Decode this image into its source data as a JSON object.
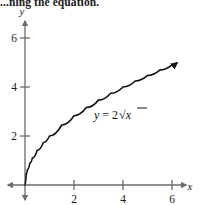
{
  "header": {
    "cutoff_text": "...ning the equation."
  },
  "figure": {
    "axis_x_label": "x",
    "axis_y_label": "y",
    "equation_label": "y = 2√x",
    "equation_parts": {
      "lhs": "y",
      "operator": "=",
      "coefficient": "2",
      "radicand": "x"
    },
    "colors": {
      "axis": "#6b6b6b",
      "curve": "#111111",
      "text": "#1a1a1a",
      "background": "#ffffff"
    }
  },
  "chart_data": {
    "type": "line",
    "title": "",
    "xlabel": "x",
    "ylabel": "y",
    "xlim": [
      -0.8,
      7.1
    ],
    "ylim": [
      -0.9,
      6.7
    ],
    "xticks": [
      2,
      4,
      6
    ],
    "yticks": [
      2,
      4,
      6
    ],
    "xtick_labels": [
      "2",
      "4",
      "6"
    ],
    "ytick_labels": [
      "2",
      "4",
      "6"
    ],
    "grid": false,
    "legend": "none",
    "annotations": [
      {
        "text": "y = 2√x",
        "x": 3.2,
        "y": 2.9
      }
    ],
    "series": [
      {
        "name": "y = 2√x",
        "equation": "y = 2*sqrt(x)",
        "arrow_end": true,
        "x": [
          0,
          0.05,
          0.1,
          0.2,
          0.3,
          0.5,
          0.75,
          1,
          1.5,
          2,
          2.5,
          3,
          3.5,
          4,
          4.5,
          5,
          5.5,
          6,
          6.2
        ],
        "y": [
          0,
          0.447,
          0.632,
          0.894,
          1.095,
          1.414,
          1.732,
          2,
          2.449,
          2.828,
          3.162,
          3.464,
          3.742,
          4,
          4.243,
          4.472,
          4.69,
          4.899,
          4.98
        ]
      }
    ]
  }
}
